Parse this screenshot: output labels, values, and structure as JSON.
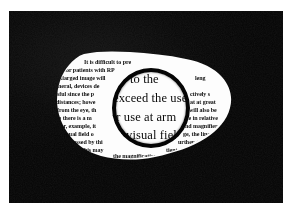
{
  "scene": {
    "title": "Magnifying lens held over a torn page of printed text",
    "background_color": "#060606",
    "paper_color": "#fdfdfd",
    "ink_color": "#0d0d0d",
    "rim_color": "#050505",
    "border_color": "#ffffff"
  },
  "lens": {
    "label": "magnifier-lens",
    "center_x": 142,
    "center_y": 97,
    "radius": 39,
    "rim_thickness": 4.5,
    "magnified_lines": [
      "to  the",
      "exceed the use",
      "or  use  at  arm",
      "t's visual fiel"
    ]
  },
  "page": {
    "label": "torn-printed-page",
    "lines": [
      "It   is   difficult   to   pre",
      "for patients with RP",
      "nlarged image will",
      "neral, devices de",
      "sful since the p",
      "distances; howe",
      "from  the  eye,  th",
      "ce  there  is  a  m",
      "For,  example,  it",
      "visual field o",
      "passed  by  thi",
      "this   may"
    ],
    "right_fragments": [
      "leng",
      "ctively s",
      "at at great",
      "will also be",
      "ce in relative",
      "nd magnifier",
      "ge, the linea",
      "urther dista",
      "tient    a"
    ],
    "underlined_fragment": "the magnification"
  }
}
